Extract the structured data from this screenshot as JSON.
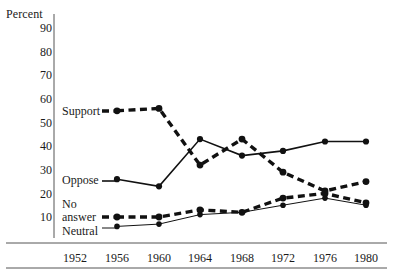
{
  "chart_data": {
    "type": "line",
    "title": "",
    "xlabel": "",
    "ylabel": "Percent",
    "ylim": [
      0,
      95
    ],
    "xlim": [
      1950,
      1982
    ],
    "grid": false,
    "legend_position": "inline-left",
    "categories": [
      1952,
      1956,
      1960,
      1964,
      1968,
      1972,
      1976,
      1980
    ],
    "ytick_labels": [
      "90",
      "80",
      "70",
      "60",
      "50",
      "40",
      "30",
      "20",
      "10"
    ],
    "ytick_values": [
      90,
      80,
      70,
      60,
      50,
      40,
      30,
      20,
      10
    ],
    "xtick_labels": [
      "1952",
      "1956",
      "1960",
      "1964",
      "1968",
      "1972",
      "1976",
      "1980"
    ],
    "series": [
      {
        "name": "Support",
        "label": "Support",
        "style": "thick-dashed",
        "color": "#111111",
        "x": [
          1956,
          1960,
          1964,
          1968,
          1972,
          1976,
          1980
        ],
        "values": [
          55,
          56,
          32,
          43,
          29,
          21,
          25
        ]
      },
      {
        "name": "Oppose",
        "label": "Oppose",
        "style": "solid",
        "color": "#111111",
        "x": [
          1956,
          1960,
          1964,
          1968,
          1972,
          1976,
          1980
        ],
        "values": [
          26,
          23,
          43,
          36,
          38,
          42,
          42
        ]
      },
      {
        "name": "No answer",
        "label": "No\nanswer",
        "label_line1": "No",
        "label_line2": "answer",
        "style": "thick-dashed",
        "color": "#111111",
        "x": [
          1956,
          1960,
          1964,
          1968,
          1972,
          1976,
          1980
        ],
        "values": [
          10,
          10,
          13,
          12,
          18,
          20,
          16
        ]
      },
      {
        "name": "Neutral",
        "label": "Neutral",
        "style": "thin-solid",
        "color": "#111111",
        "x": [
          1956,
          1960,
          1964,
          1968,
          1972,
          1976,
          1980
        ],
        "values": [
          6,
          7,
          11,
          12,
          15,
          18,
          15
        ]
      }
    ]
  },
  "axis": {
    "y_title": "Percent",
    "yticks": [
      "90",
      "80",
      "70",
      "60",
      "50",
      "40",
      "30",
      "20",
      "10"
    ],
    "xticks": [
      "1952",
      "1956",
      "1960",
      "1964",
      "1968",
      "1972",
      "1976",
      "1980"
    ]
  },
  "labels": {
    "support": "Support",
    "oppose": "Oppose",
    "no_answer_line1": "No",
    "no_answer_line2": "answer",
    "neutral": "Neutral"
  },
  "colors": {
    "ink": "#111111",
    "axis": "#555555",
    "background": "#ffffff"
  }
}
